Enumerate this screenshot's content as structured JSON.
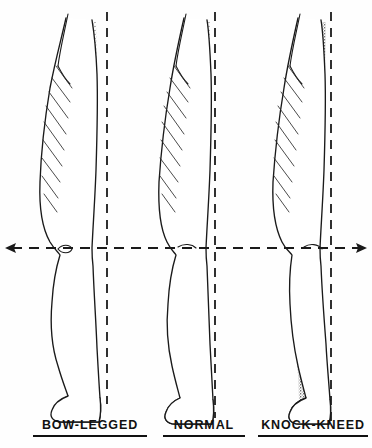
{
  "figure": {
    "background_color": "#fefefe",
    "ink_color": "#1a1a1a",
    "stipple_color": "#6e6e6e",
    "width": 372,
    "height": 448
  },
  "axis": {
    "name": "horizontal-knee-reference-line",
    "style": "dashed",
    "y": 248,
    "x_start": 6,
    "x_end": 366,
    "left_arrow": true,
    "right_arrow": true,
    "description": "Horizontal dashed reference line through the knee joints with arrowheads at both ends"
  },
  "panels": [
    {
      "id": "bow-legged",
      "label": "BOW-LEGGED",
      "label_x": 90,
      "plumb_line_x": 107,
      "plumb_line_top": 12,
      "plumb_line_bottom": 404,
      "knee_x": 68,
      "knee_y": 248,
      "alignment": "knee falls lateral (outside) of the plumb line",
      "hatch_count": 9
    },
    {
      "id": "normal",
      "label": "NORMAL",
      "label_x": 204,
      "plumb_line_x": 215,
      "plumb_line_top": 12,
      "plumb_line_bottom": 418,
      "knee_x": 190,
      "knee_y": 248,
      "alignment": "knee falls on the plumb line",
      "hatch_count": 9
    },
    {
      "id": "knock-kneed",
      "label": "KNOCK-KNEED",
      "label_x": 318,
      "plumb_line_x": 331,
      "plumb_line_top": 12,
      "plumb_line_bottom": 424,
      "knee_x": 316,
      "knee_y": 248,
      "alignment": "knee falls medial (inside) of the plumb line",
      "hatch_count": 9
    }
  ],
  "legend": {
    "stipple_meaning": "shaded posterior band",
    "hatch_meaning": "hatched thigh musculature"
  }
}
